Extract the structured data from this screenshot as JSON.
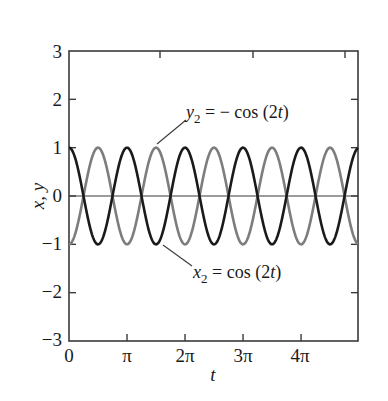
{
  "chart_data": {
    "type": "line",
    "title": "",
    "xlabel": "t",
    "ylabel": "x, y",
    "xlim": [
      0,
      15.65
    ],
    "ylim": [
      -3,
      3
    ],
    "grid": false,
    "legend": "none (inline annotations)",
    "x_ticks": [
      {
        "value": 0,
        "label": "0"
      },
      {
        "value": 3.14159,
        "label": "π"
      },
      {
        "value": 6.28319,
        "label": "2π"
      },
      {
        "value": 9.42478,
        "label": "3π"
      },
      {
        "value": 12.56637,
        "label": "4π"
      }
    ],
    "y_ticks": [
      {
        "value": -3,
        "label": "−3"
      },
      {
        "value": -2,
        "label": "−2"
      },
      {
        "value": -1,
        "label": "−1"
      },
      {
        "value": 0,
        "label": "0"
      },
      {
        "value": 1,
        "label": "1"
      },
      {
        "value": 2,
        "label": "2"
      },
      {
        "value": 3,
        "label": "3"
      }
    ],
    "series": [
      {
        "name": "x2 = cos(2t)",
        "expression": "cos(2t)",
        "color": "#1a1a1a",
        "amplitude": 1,
        "angular_frequency": 2,
        "phase": 0
      },
      {
        "name": "y2 = -cos(2t)",
        "expression": "-cos(2t)",
        "color": "#7d7d7d",
        "amplitude": 1,
        "angular_frequency": 2,
        "phase": 3.14159
      }
    ],
    "annotations": [
      {
        "text_base": "y",
        "text_sub": "2",
        "text_rest": " = − cos (2",
        "text_var": "t",
        "text_end": ")",
        "points_to": "y2 = -cos(2t)",
        "position": "upper"
      },
      {
        "text_base": "x",
        "text_sub": "2",
        "text_rest": " = cos (2",
        "text_var": "t",
        "text_end": ")",
        "points_to": "x2 = cos(2t)",
        "position": "lower"
      }
    ],
    "zero_line": true
  },
  "labels": {
    "xlabel": "t",
    "ylabel": "x, y",
    "xticks": [
      "0",
      "π",
      "2π",
      "3π",
      "4π"
    ],
    "yticks": [
      "3",
      "2",
      "1",
      "0",
      "−1",
      "−2",
      "−3"
    ],
    "annot_y_base": "y",
    "annot_y_sub": "2",
    "annot_y_rest": " = − cos (2",
    "annot_y_var": "t",
    "annot_y_end": ")",
    "annot_x_base": "x",
    "annot_x_sub": "2",
    "annot_x_rest": " = cos (2",
    "annot_x_var": "t",
    "annot_x_end": ")"
  },
  "colors": {
    "x2_curve": "#1a1a1a",
    "y2_curve": "#7d7d7d",
    "axes": "#3a3a3a"
  }
}
